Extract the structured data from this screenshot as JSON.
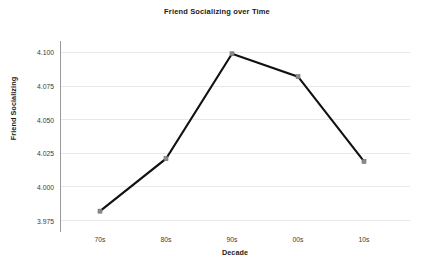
{
  "chart_data": {
    "type": "line",
    "title": "Friend Socializing over Time",
    "xlabel": "Decade",
    "ylabel": "Friend Socializing",
    "categories": [
      "70s",
      "80s",
      "90s",
      "00s",
      "10s"
    ],
    "values": [
      3.982,
      4.021,
      4.099,
      4.082,
      4.019
    ],
    "series": [
      {
        "name": "Friend Socializing",
        "values": [
          3.982,
          4.021,
          4.099,
          4.082,
          4.019
        ]
      }
    ],
    "ylim": [
      3.9665,
      4.1085
    ],
    "yticks": [
      3.975,
      4.0,
      4.025,
      4.05,
      4.075,
      4.1
    ],
    "ytick_labels": [
      "3.975",
      "4.000",
      "4.025",
      "4.050",
      "4.075",
      "4.100"
    ],
    "grid": "horizontal",
    "legend": "none",
    "line_color": "#111111",
    "marker_color": "#8a8a8a",
    "grid_color": "#e8e8e8",
    "axis_color": "#5a5a5a",
    "background_color": "#ffffff"
  }
}
